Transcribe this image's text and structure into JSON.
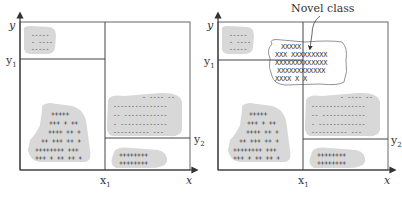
{
  "figure": {
    "left_panel": {
      "axis_x": "x",
      "axis_y": "y",
      "tick_x1": "x",
      "tick_x1_sub": "1",
      "tick_y1": "y",
      "tick_y1_sub": "1",
      "tick_y2": "y",
      "tick_y2_sub": "2",
      "clusters": {
        "top_left": [
          "-----",
          "- ----",
          "-----"
        ],
        "bottom_left": [
          "+++++",
          "+++ + ++",
          "++++ ++ +",
          "++ +++ ++ +",
          "++++++++ +++",
          "+++ + ++ ++ +"
        ],
        "right_upper": [
          "- ---- --",
          "---------------",
          "-- ------------",
          "- -------------",
          "----------  ---"
        ],
        "right_lower": [
          "++++++++",
          "++++++++"
        ]
      }
    },
    "right_panel": {
      "axis_x": "x",
      "axis_y": "y",
      "tick_x1": "x",
      "tick_x1_sub": "1",
      "tick_y1": "y",
      "tick_y1_sub": "1",
      "tick_y2": "y",
      "tick_y2_sub": "2",
      "annotation": "Novel class",
      "novel_cluster": [
        "XXXXX",
        "XXX XXXXXXXXX",
        "XXXXXXXXXXXXX",
        "XXXXXXXXXXXX",
        "XXXX        X X"
      ],
      "clusters": {
        "top_left": [
          "-----",
          "- ----",
          "-----"
        ],
        "bottom_left": [
          "+++++",
          "+++ + ++",
          "++++ ++ +",
          "++ +++ ++ +",
          "++++++++ +++",
          "+++ + ++ ++ +"
        ],
        "right_upper": [
          "- ---- --",
          "---------------",
          "-- ------------",
          "- -------------",
          "----------  ---"
        ],
        "right_lower": [
          "++++++++",
          "++++++++"
        ]
      }
    },
    "colors": {
      "cluster_fill": "#d6d6d6",
      "line": "#555555",
      "text": "#333333"
    }
  }
}
